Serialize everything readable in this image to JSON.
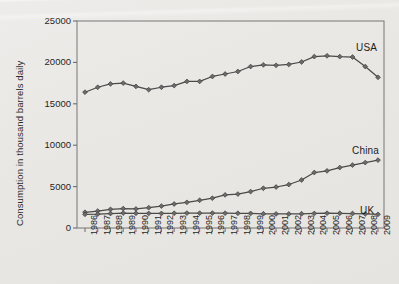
{
  "chart_data": {
    "type": "line",
    "title": "",
    "subtitle": "",
    "xlabel": "",
    "ylabel": "Consumption in thousand barrels daily",
    "xlim": [
      1986,
      2009
    ],
    "ylim": [
      0,
      25000
    ],
    "ytick_values": [
      0,
      5000,
      10000,
      15000,
      20000,
      25000
    ],
    "ytick_labels": [
      "0",
      "5000",
      "10000",
      "15000",
      "20000",
      "25000"
    ],
    "grid": false,
    "legend_position": "inline-right",
    "marker": "diamond",
    "line_color": "#4a4a4a",
    "background_color": "#eceae6",
    "plot_border_color": "#808080",
    "categories": [
      "1986",
      "1987",
      "1988",
      "1989",
      "1990",
      "1991",
      "1992",
      "1993",
      "1994",
      "1995",
      "1996",
      "1997",
      "1998",
      "1999",
      "2000",
      "2001",
      "2002",
      "2003",
      "2004",
      "2005",
      "2006",
      "2007",
      "2008",
      "2009"
    ],
    "series": [
      {
        "name": "USA",
        "label": "USA",
        "label_x": 356,
        "label_y": 42,
        "values": [
          16400,
          17000,
          17400,
          17500,
          17100,
          16700,
          17000,
          17200,
          17700,
          17700,
          18300,
          18600,
          18900,
          19500,
          19700,
          19650,
          19750,
          20050,
          20700,
          20800,
          20700,
          20650,
          19500,
          18200
        ]
      },
      {
        "name": "China",
        "label": "China",
        "label_x": 352,
        "label_y": 145,
        "values": [
          1900,
          2050,
          2250,
          2350,
          2300,
          2450,
          2650,
          2900,
          3100,
          3350,
          3600,
          4000,
          4100,
          4400,
          4800,
          4950,
          5250,
          5800,
          6700,
          6900,
          7300,
          7600,
          7900,
          8200
        ]
      },
      {
        "name": "UK",
        "label": "UK",
        "label_x": 360,
        "label_y": 205,
        "values": [
          1650,
          1680,
          1750,
          1800,
          1780,
          1760,
          1760,
          1780,
          1800,
          1790,
          1800,
          1790,
          1780,
          1760,
          1720,
          1700,
          1700,
          1720,
          1760,
          1790,
          1780,
          1750,
          1700,
          1650
        ]
      }
    ]
  }
}
